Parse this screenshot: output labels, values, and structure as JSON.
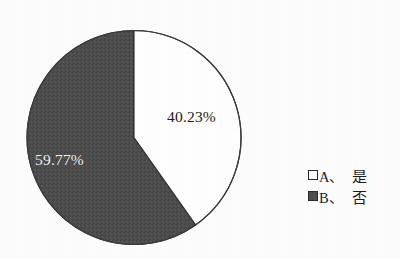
{
  "chart_data": {
    "type": "pie",
    "title": "",
    "labels": [
      "A、是",
      "B、否"
    ],
    "values": [
      40.23,
      59.77
    ],
    "value_labels": [
      "40.23%",
      "59.77%"
    ],
    "units": "percent",
    "start_angle_deg": 0,
    "direction": "clockwise",
    "legend_position": "right",
    "grid": false,
    "slice_colors": [
      "#ffffff",
      "#4e4e4e"
    ],
    "slice_border_color": "#333333",
    "slices": [
      {
        "key": "A",
        "label": "A、是",
        "value": 40.23,
        "value_label": "40.23%",
        "color": "#ffffff",
        "label_text_color": "#1d1d1d"
      },
      {
        "key": "B",
        "label": "B、否",
        "value": 59.77,
        "value_label": "59.77%",
        "color": "#4e4e4e",
        "label_text_color": "#f4f4f4"
      }
    ]
  },
  "pie": {
    "label_a": "40.23%",
    "label_b": "59.77%"
  },
  "legend": {
    "items": [
      {
        "key": "A、",
        "name": "是",
        "swatch": "hollow-square"
      },
      {
        "key": "B、",
        "name": "否",
        "swatch": "filled-square"
      }
    ]
  },
  "colors": {
    "background": "#fdfdfd",
    "slice_a": "#ffffff",
    "slice_b": "#4e4e4e",
    "outline": "#333333",
    "text": "#1d1d1d",
    "text_on_dark": "#f4f4f4"
  }
}
